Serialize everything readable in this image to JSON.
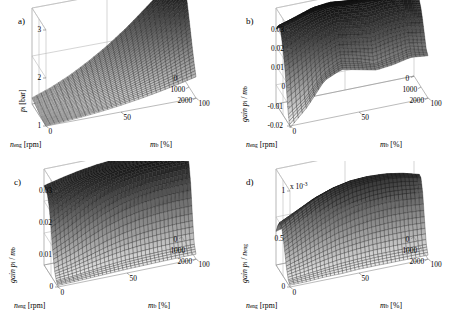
{
  "figure": {
    "background": "#ffffff",
    "panel_count": 4
  },
  "panels": [
    {
      "tag": "a)",
      "zlabel_main": "p",
      "zlabel_sub": "i",
      "zlabel_unit": "[bar]",
      "ztick_labels": [
        "1",
        "2",
        "3"
      ],
      "exp_label": "",
      "xlabel_main": "n",
      "xlabel_sub": "eng",
      "xlabel_unit": "[rpm]",
      "xtick_labels": [
        "2000",
        "1000",
        "0"
      ],
      "ylabel_main": "m",
      "ylabel_sub": "b",
      "ylabel_unit": "[%]",
      "ytick_labels": [
        "0",
        "50",
        "100"
      ]
    },
    {
      "tag": "b)",
      "zlabel_main": "gain  p",
      "zlabel_sub": "i",
      "zlabel_den": "m",
      "zlabel_den_sub": "b",
      "zlabel_unit": "",
      "ztick_labels": [
        "-0.02",
        "-0.01",
        "0",
        "0.01",
        "0.02",
        "0.03"
      ],
      "exp_label": "",
      "xlabel_main": "n",
      "xlabel_sub": "eng",
      "xlabel_unit": "[rpm]",
      "xtick_labels": [
        "2000",
        "1000",
        "0"
      ],
      "ylabel_main": "m",
      "ylabel_sub": "b",
      "ylabel_unit": "[%]",
      "ytick_labels": [
        "0",
        "50",
        "100"
      ]
    },
    {
      "tag": "c)",
      "zlabel_main": "gain  p",
      "zlabel_sub": "i",
      "zlabel_den": "m",
      "zlabel_den_sub": "b",
      "zlabel_unit": "",
      "ztick_labels": [
        "0",
        "0.01",
        "0.02",
        "0.03"
      ],
      "exp_label": "",
      "xlabel_main": "n",
      "xlabel_sub": "eng",
      "xlabel_unit": "[rpm]",
      "xtick_labels": [
        "2000",
        "1000",
        "0"
      ],
      "ylabel_main": "m",
      "ylabel_sub": "b",
      "ylabel_unit": "[%]",
      "ytick_labels": [
        "0",
        "50",
        "100"
      ]
    },
    {
      "tag": "d)",
      "zlabel_main": "gain  p",
      "zlabel_sub": "i",
      "zlabel_den": "n",
      "zlabel_den_sub": "eng",
      "zlabel_unit": "",
      "ztick_labels": [
        "0",
        "0.5",
        "1"
      ],
      "exp_label": "x 10",
      "exp_power": "-3",
      "xlabel_main": "n",
      "xlabel_sub": "eng",
      "xlabel_unit": "[rpm]",
      "xtick_labels": [
        "2000",
        "1000",
        "0"
      ],
      "ylabel_main": "m",
      "ylabel_sub": "b",
      "ylabel_unit": "[%]",
      "ytick_labels": [
        "0",
        "50",
        "100"
      ]
    }
  ],
  "chart_data": [
    {
      "type": "surface",
      "panel": "a",
      "title": "",
      "xlabel": "n_eng [rpm]",
      "ylabel": "m_b [%]",
      "zlabel": "p_i [bar]",
      "xlim": [
        0,
        2000
      ],
      "ylim": [
        0,
        100
      ],
      "zlim": [
        1,
        3
      ],
      "xticks": [
        0,
        1000,
        2000
      ],
      "yticks": [
        0,
        50,
        100
      ],
      "zticks": [
        1,
        2,
        3
      ],
      "grid": true,
      "description": "Monotonic bowl/ramp surface; minimum near 1 bar at low engine speed and low fuel mass, rising steeply to about 3 bar at high engine speed and high fuel mass",
      "x": [
        0,
        250,
        500,
        750,
        1000,
        1250,
        1500,
        1750,
        2000
      ],
      "y": [
        0,
        12.5,
        25,
        37.5,
        50,
        62.5,
        75,
        87.5,
        100
      ],
      "z": [
        [
          1.0,
          1.02,
          1.05,
          1.09,
          1.14,
          1.2,
          1.27,
          1.35,
          1.44
        ],
        [
          1.01,
          1.04,
          1.08,
          1.14,
          1.21,
          1.3,
          1.4,
          1.52,
          1.65
        ],
        [
          1.02,
          1.06,
          1.12,
          1.2,
          1.3,
          1.42,
          1.56,
          1.72,
          1.9
        ],
        [
          1.03,
          1.09,
          1.17,
          1.27,
          1.4,
          1.56,
          1.74,
          1.95,
          2.17
        ],
        [
          1.05,
          1.12,
          1.22,
          1.35,
          1.51,
          1.7,
          1.92,
          2.17,
          2.44
        ],
        [
          1.07,
          1.16,
          1.28,
          1.43,
          1.62,
          1.84,
          2.1,
          2.39,
          2.7
        ],
        [
          1.09,
          1.2,
          1.34,
          1.52,
          1.73,
          1.98,
          2.27,
          2.59,
          2.92
        ],
        [
          1.11,
          1.24,
          1.4,
          1.6,
          1.83,
          2.11,
          2.42,
          2.76,
          3.05
        ],
        [
          1.13,
          1.27,
          1.45,
          1.67,
          1.92,
          2.21,
          2.54,
          2.88,
          3.0
        ]
      ]
    },
    {
      "type": "surface",
      "panel": "b",
      "title": "",
      "xlabel": "n_eng [rpm]",
      "ylabel": "m_b [%]",
      "zlabel": "gain p_i / m_b",
      "xlim": [
        0,
        2000
      ],
      "ylim": [
        0,
        100
      ],
      "zlim": [
        -0.02,
        0.03
      ],
      "xticks": [
        0,
        1000,
        2000
      ],
      "yticks": [
        0,
        50,
        100
      ],
      "zticks": [
        -0.02,
        -0.01,
        0,
        0.01,
        0.02,
        0.03
      ],
      "grid": true,
      "description": "Rough, noisy surface with sharp ridges and deep notches; plateau near 0.02-0.03 over the high fuel mass region, dropping below -0.02 in a narrow spike at low engine speed and low fuel mass",
      "x": [
        0,
        250,
        500,
        750,
        1000,
        1250,
        1500,
        1750,
        2000
      ],
      "y": [
        0,
        12.5,
        25,
        37.5,
        50,
        62.5,
        75,
        87.5,
        100
      ],
      "z": [
        [
          -0.021,
          -0.012,
          0.0,
          0.004,
          0.002,
          0.0,
          0.001,
          0.003,
          0.002
        ],
        [
          -0.015,
          -0.008,
          0.002,
          0.007,
          0.005,
          0.002,
          0.004,
          0.006,
          0.004
        ],
        [
          -0.004,
          0.002,
          0.009,
          0.013,
          0.011,
          0.009,
          0.011,
          0.012,
          0.01
        ],
        [
          0.006,
          0.011,
          0.016,
          0.019,
          0.017,
          0.016,
          0.018,
          0.018,
          0.016
        ],
        [
          0.014,
          0.018,
          0.022,
          0.024,
          0.023,
          0.022,
          0.023,
          0.023,
          0.021
        ],
        [
          0.02,
          0.023,
          0.026,
          0.028,
          0.027,
          0.026,
          0.027,
          0.026,
          0.024
        ],
        [
          0.024,
          0.026,
          0.029,
          0.03,
          0.029,
          0.029,
          0.029,
          0.028,
          0.026
        ],
        [
          0.022,
          0.025,
          0.028,
          0.029,
          0.028,
          0.028,
          0.027,
          0.026,
          0.024
        ],
        [
          0.019,
          0.021,
          0.024,
          0.025,
          0.024,
          0.024,
          0.023,
          0.022,
          0.02
        ]
      ]
    },
    {
      "type": "surface",
      "panel": "c",
      "title": "",
      "xlabel": "n_eng [rpm]",
      "ylabel": "m_b [%]",
      "zlabel": "gain p_i / m_b",
      "xlim": [
        0,
        2000
      ],
      "ylim": [
        0,
        100
      ],
      "zlim": [
        0,
        0.03
      ],
      "xticks": [
        0,
        1000,
        2000
      ],
      "yticks": [
        0,
        50,
        100
      ],
      "zticks": [
        0,
        0.01,
        0.02,
        0.03
      ],
      "grid": true,
      "description": "Smooth sigmoid ramp rising from near 0 at low fuel mass to a flat plateau near 0.025-0.03 at high fuel mass; weak dependence on engine speed",
      "x": [
        0,
        250,
        500,
        750,
        1000,
        1250,
        1500,
        1750,
        2000
      ],
      "y": [
        0,
        12.5,
        25,
        37.5,
        50,
        62.5,
        75,
        87.5,
        100
      ],
      "z": [
        [
          0.0005,
          0.0006,
          0.0008,
          0.001,
          0.0012,
          0.0013,
          0.0014,
          0.0015,
          0.0015
        ],
        [
          0.0012,
          0.0016,
          0.0022,
          0.0028,
          0.0033,
          0.0036,
          0.0038,
          0.0039,
          0.0039
        ],
        [
          0.0035,
          0.0048,
          0.0065,
          0.0082,
          0.0095,
          0.0104,
          0.0109,
          0.0112,
          0.0112
        ],
        [
          0.0085,
          0.011,
          0.014,
          0.0166,
          0.0185,
          0.0197,
          0.0204,
          0.0207,
          0.0207
        ],
        [
          0.015,
          0.018,
          0.021,
          0.0233,
          0.0248,
          0.0257,
          0.0262,
          0.0264,
          0.0264
        ],
        [
          0.0205,
          0.023,
          0.0252,
          0.0267,
          0.0277,
          0.0283,
          0.0286,
          0.0287,
          0.0287
        ],
        [
          0.0235,
          0.0252,
          0.0267,
          0.0277,
          0.0283,
          0.0287,
          0.0289,
          0.029,
          0.029
        ],
        [
          0.0245,
          0.0259,
          0.0271,
          0.0279,
          0.0284,
          0.0287,
          0.0289,
          0.029,
          0.029
        ],
        [
          0.0248,
          0.0261,
          0.0272,
          0.028,
          0.0285,
          0.0288,
          0.029,
          0.029,
          0.029
        ]
      ]
    },
    {
      "type": "surface",
      "panel": "d",
      "title": "",
      "xlabel": "n_eng [rpm]",
      "ylabel": "m_b [%]",
      "zlabel": "gain p_i / n_eng",
      "zscale_multiplier": "x 10^-3",
      "xlim": [
        0,
        2000
      ],
      "ylim": [
        0,
        100
      ],
      "zlim": [
        0,
        1
      ],
      "xticks": [
        0,
        1000,
        2000
      ],
      "yticks": [
        0,
        50,
        100
      ],
      "zticks": [
        0,
        0.5,
        1
      ],
      "grid": true,
      "description": "Broad dome; value near 0 at low fuel mass, rising to a rounded hill peaking near 0.8e-3 at mid-to-high fuel mass and mid engine speed, then falling toward 0.35e-3 at the highest fuel mass",
      "x": [
        0,
        250,
        500,
        750,
        1000,
        1250,
        1500,
        1750,
        2000
      ],
      "y": [
        0,
        12.5,
        25,
        37.5,
        50,
        62.5,
        75,
        87.5,
        100
      ],
      "z": [
        [
          0.02,
          0.02,
          0.03,
          0.03,
          0.04,
          0.04,
          0.04,
          0.04,
          0.04
        ],
        [
          0.05,
          0.07,
          0.09,
          0.11,
          0.12,
          0.13,
          0.13,
          0.13,
          0.13
        ],
        [
          0.14,
          0.19,
          0.25,
          0.3,
          0.33,
          0.35,
          0.36,
          0.36,
          0.35
        ],
        [
          0.28,
          0.37,
          0.46,
          0.54,
          0.59,
          0.62,
          0.63,
          0.62,
          0.6
        ],
        [
          0.42,
          0.53,
          0.64,
          0.72,
          0.77,
          0.79,
          0.79,
          0.77,
          0.73
        ],
        [
          0.5,
          0.61,
          0.71,
          0.78,
          0.82,
          0.83,
          0.82,
          0.79,
          0.74
        ],
        [
          0.5,
          0.59,
          0.68,
          0.74,
          0.77,
          0.77,
          0.75,
          0.71,
          0.66
        ],
        [
          0.44,
          0.51,
          0.58,
          0.63,
          0.65,
          0.64,
          0.62,
          0.58,
          0.53
        ],
        [
          0.35,
          0.4,
          0.45,
          0.48,
          0.49,
          0.48,
          0.46,
          0.43,
          0.39
        ]
      ]
    }
  ]
}
